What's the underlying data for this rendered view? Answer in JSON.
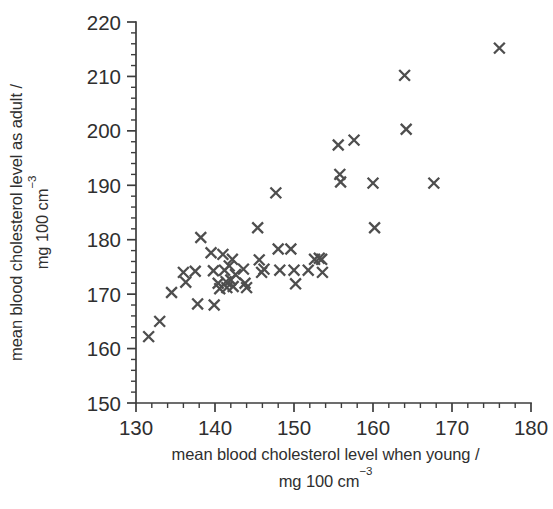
{
  "chart_data": {
    "type": "scatter",
    "title": "",
    "xlabel": "mean blood cholesterol level when young /",
    "xlabel_line2": "mg 100 cm",
    "xlabel_line2_sup": "−3",
    "ylabel": "mean blood cholesterol level as adult /",
    "ylabel_line2": "mg 100 cm",
    "ylabel_line2_sup": "−3",
    "xlim": [
      130,
      180
    ],
    "ylim": [
      150,
      220
    ],
    "x_ticks": [
      130,
      140,
      150,
      160,
      170,
      180
    ],
    "y_ticks": [
      150,
      160,
      170,
      180,
      190,
      200,
      210,
      220
    ],
    "x_tick_labels": [
      "130",
      "140",
      "150",
      "160",
      "170",
      "180"
    ],
    "y_tick_labels": [
      "150",
      "160",
      "170",
      "180",
      "190",
      "200",
      "210",
      "220"
    ],
    "x_minor_step": 2,
    "y_minor_step": 2,
    "grid": false,
    "legend": null,
    "marker_symbol": "x",
    "marker_color": "#4e4e4e",
    "axis_color": "#3d3d3d",
    "background_color": "#ffffff",
    "points": [
      [
        131.6,
        162.2
      ],
      [
        133.0,
        165.0
      ],
      [
        134.5,
        170.3
      ],
      [
        136.0,
        174.0
      ],
      [
        136.3,
        172.2
      ],
      [
        137.5,
        174.2
      ],
      [
        137.8,
        168.2
      ],
      [
        138.2,
        180.4
      ],
      [
        139.5,
        177.6
      ],
      [
        139.8,
        174.3
      ],
      [
        139.9,
        168.0
      ],
      [
        140.4,
        172.0
      ],
      [
        140.6,
        171.0
      ],
      [
        141.0,
        177.3
      ],
      [
        141.2,
        174.4
      ],
      [
        141.4,
        172.3
      ],
      [
        141.5,
        171.2
      ],
      [
        141.8,
        175.2
      ],
      [
        142.0,
        172.6
      ],
      [
        142.2,
        176.4
      ],
      [
        142.3,
        171.4
      ],
      [
        142.6,
        173.6
      ],
      [
        143.6,
        174.6
      ],
      [
        143.8,
        172.0
      ],
      [
        144.0,
        171.2
      ],
      [
        145.4,
        182.2
      ],
      [
        145.6,
        176.3
      ],
      [
        145.9,
        174.0
      ],
      [
        146.2,
        174.6
      ],
      [
        147.7,
        188.6
      ],
      [
        148.0,
        178.3
      ],
      [
        148.2,
        174.4
      ],
      [
        149.6,
        178.3
      ],
      [
        150.0,
        174.4
      ],
      [
        150.2,
        171.9
      ],
      [
        151.8,
        174.4
      ],
      [
        152.6,
        176.4
      ],
      [
        153.2,
        176.6
      ],
      [
        153.5,
        176.4
      ],
      [
        153.6,
        174.0
      ],
      [
        155.6,
        197.4
      ],
      [
        155.8,
        192.0
      ],
      [
        155.9,
        190.6
      ],
      [
        157.6,
        198.3
      ],
      [
        160.0,
        190.4
      ],
      [
        160.2,
        182.2
      ],
      [
        164.0,
        210.2
      ],
      [
        164.2,
        200.3
      ],
      [
        167.7,
        190.4
      ],
      [
        176.0,
        215.2
      ]
    ]
  }
}
